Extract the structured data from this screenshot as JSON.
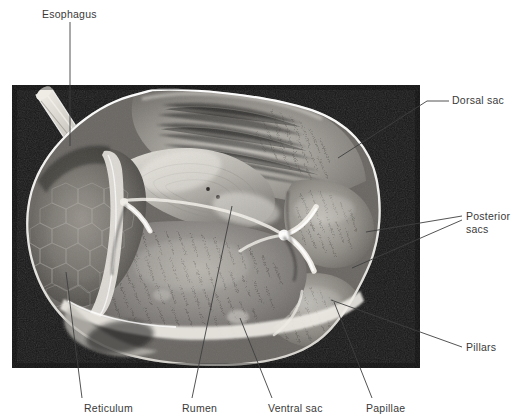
{
  "figure": {
    "plate": {
      "left": 12,
      "top": 85,
      "width": 408,
      "height": 283,
      "background_color": "#161616"
    },
    "ink_color": "#3a3a3a",
    "leader_color": "#3f3f3f"
  },
  "labels": [
    {
      "id": "esophagus",
      "text": "Esophagus",
      "x": 42,
      "y": 8,
      "leaders": [
        [
          [
            70,
            22
          ],
          [
            70,
            146
          ]
        ]
      ]
    },
    {
      "id": "dorsal-sac",
      "text": "Dorsal sac",
      "x": 452,
      "y": 94,
      "leaders": [
        [
          [
            449,
            101
          ],
          [
            427,
            101
          ],
          [
            338,
            158
          ]
        ]
      ]
    },
    {
      "id": "posterior-sacs",
      "text": "Posterior\nsacs",
      "x": 466,
      "y": 210,
      "leaders": [
        [
          [
            462,
            216
          ],
          [
            366,
            232
          ]
        ],
        [
          [
            462,
            220
          ],
          [
            352,
            268
          ]
        ]
      ]
    },
    {
      "id": "pillars",
      "text": "Pillars",
      "x": 466,
      "y": 341,
      "leaders": [
        [
          [
            462,
            347
          ],
          [
            331,
            300
          ]
        ]
      ]
    },
    {
      "id": "reticulum",
      "text": "Reticulum",
      "x": 84,
      "y": 402,
      "leaders": [
        [
          [
            82,
            398
          ],
          [
            66,
            272
          ]
        ]
      ]
    },
    {
      "id": "rumen",
      "text": "Rumen",
      "x": 182,
      "y": 402,
      "leaders": [
        [
          [
            192,
            398
          ],
          [
            232,
            206
          ]
        ]
      ]
    },
    {
      "id": "ventral-sac",
      "text": "Ventral sac",
      "x": 268,
      "y": 402,
      "leaders": [
        [
          [
            272,
            398
          ],
          [
            240,
            318
          ]
        ]
      ]
    },
    {
      "id": "papillae",
      "text": "Papillae",
      "x": 366,
      "y": 402,
      "leaders": [
        [
          [
            372,
            398
          ],
          [
            334,
            302
          ]
        ]
      ]
    }
  ],
  "anatomy_regions": [
    {
      "id": "dorsal-sac-region",
      "name": "Dorsal sac"
    },
    {
      "id": "posterior-sac-upper",
      "name": "Posterior sac (dorsal)"
    },
    {
      "id": "posterior-sac-lower",
      "name": "Posterior sac (ventral)"
    },
    {
      "id": "ventral-sac-region",
      "name": "Ventral sac"
    },
    {
      "id": "reticulum-region",
      "name": "Reticulum"
    },
    {
      "id": "esophagus-stump",
      "name": "Esophagus stump"
    },
    {
      "id": "cranial-pillar",
      "name": "Cranial pillar"
    },
    {
      "id": "caudal-pillar",
      "name": "Caudal pillar"
    },
    {
      "id": "papillae-field",
      "name": "Rumen papillae"
    }
  ]
}
